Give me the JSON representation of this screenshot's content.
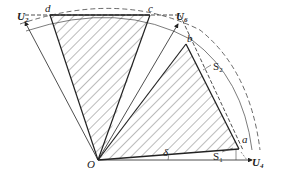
{
  "diagram": {
    "type": "voltage-vector-sector",
    "origin_label": "O",
    "angle_label": "δ",
    "vectors": [
      {
        "name": "U",
        "sub": "2"
      },
      {
        "name": "U",
        "sub": "6"
      },
      {
        "name": "U",
        "sub": "4"
      }
    ],
    "points": {
      "a": "a",
      "b": "b",
      "c": "c",
      "d": "d"
    },
    "regions": [
      {
        "name": "S",
        "sub": "1"
      },
      {
        "name": "S",
        "sub": "2"
      }
    ],
    "colors": {
      "line": "#222222",
      "hatch": "#444444",
      "dashed": "#444444"
    }
  }
}
